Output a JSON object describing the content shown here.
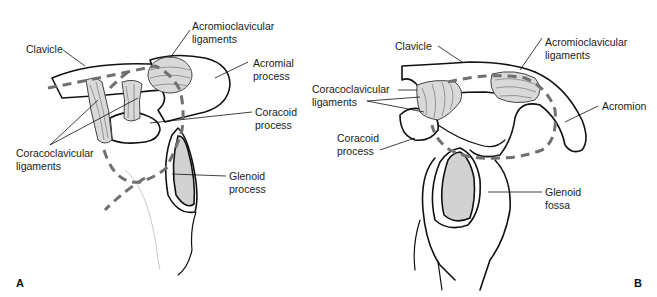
{
  "figure": {
    "panels": [
      {
        "id": "A",
        "letter": "A",
        "labels": {
          "clavicle": "Clavicle",
          "acromioclavicular_1": "Acromioclavicular",
          "acromioclavicular_2": "ligaments",
          "acromial_1": "Acromial",
          "acromial_2": "process",
          "coracoid_1": "Coracoid",
          "coracoid_2": "process",
          "coracoclavicular_1": "Coracoclavicular",
          "coracoclavicular_2": "ligaments",
          "glenoid_1": "Glenoid",
          "glenoid_2": "process"
        }
      },
      {
        "id": "B",
        "letter": "B",
        "labels": {
          "clavicle": "Clavicle",
          "acromioclavicular_1": "Acromioclavicular",
          "acromioclavicular_2": "ligaments",
          "coracoclavicular_1": "Coracoclavicular",
          "coracoclavicular_2": "ligaments",
          "acromion": "Acromion",
          "coracoid_1": "Coracoid",
          "coracoid_2": "process",
          "glenoid_1": "Glenoid",
          "glenoid_2": "fossa"
        }
      }
    ],
    "colors": {
      "outline": "#111111",
      "ligament_fill": "#d9d9d9",
      "glenoid_fill": "#d2d2d2",
      "dashed_line": "#707070"
    }
  }
}
